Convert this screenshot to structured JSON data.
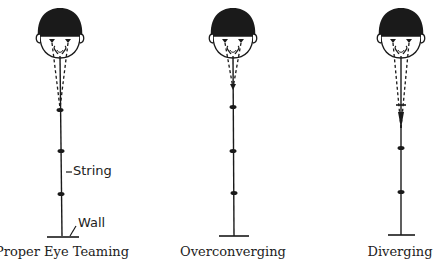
{
  "figures": [
    {
      "id": "proper",
      "caption": "Proper Eye Teaming",
      "center_x": 60,
      "convergence_y": 110,
      "description": "Eyes converge at the bead"
    },
    {
      "id": "over",
      "caption": "Overconverging",
      "center_x": 233,
      "convergence_y": 88,
      "description": "Eyes converge in front of the bead"
    },
    {
      "id": "diverge",
      "caption": "Diverging",
      "center_x": 401,
      "convergence_y": 130,
      "description": "Eyes converge beyond the bead"
    }
  ],
  "labels": {
    "string": "String",
    "wall": "Wall"
  },
  "colors": {
    "ink": "#1a1a1a",
    "background": "#ffffff"
  }
}
